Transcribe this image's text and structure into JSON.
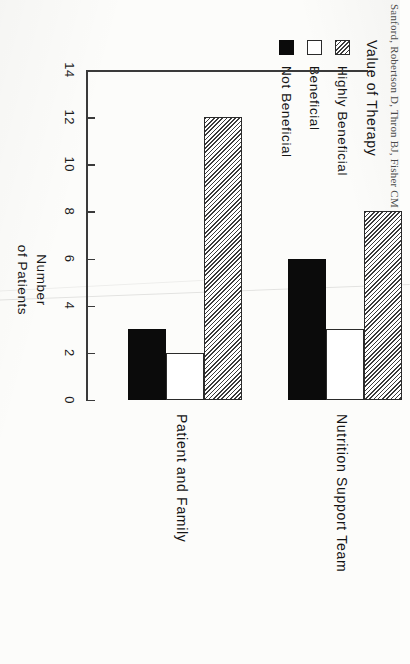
{
  "figure": {
    "rotation_note": "scanned page, figure rotated 90 degrees",
    "caption_fragment": "Sanford, Robertson D, Thron BJ, Fisher CM"
  },
  "legend": {
    "title": "Value of Therapy",
    "items": [
      {
        "label": "Highly  Beneficial",
        "swatch": "hatched-swatch"
      },
      {
        "label": "Beneficial",
        "swatch": "white-swatch"
      },
      {
        "label": "Not  Beneficial",
        "swatch": "black-swatch"
      }
    ]
  },
  "axes": {
    "value_axis_title_line1": "Number",
    "value_axis_title_line2": "of  Patients",
    "ticks": [
      "14",
      "12",
      "10",
      "8",
      "6",
      "4",
      "2",
      "0"
    ]
  },
  "chart_data": {
    "type": "bar",
    "title": "",
    "subtitle": "",
    "orientation": "grouped-bar",
    "categories": [
      "Patient  and  Family",
      "Nutrition  Support  Team"
    ],
    "series": [
      {
        "name": "Highly  Beneficial",
        "values": [
          12,
          8
        ],
        "fill": "hatched"
      },
      {
        "name": "Beneficial",
        "values": [
          2,
          3
        ],
        "fill": "white"
      },
      {
        "name": "Not  Beneficial",
        "values": [
          3,
          6
        ],
        "fill": "black"
      }
    ],
    "xlabel": "",
    "ylabel": "Number of Patients",
    "ylim": [
      0,
      14
    ],
    "ytick_step": 2,
    "grid": false,
    "legend_position": "top-left",
    "legend_title": "Value of Therapy"
  }
}
